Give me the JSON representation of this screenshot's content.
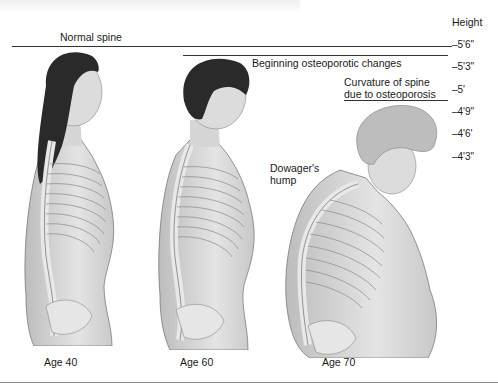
{
  "figure": {
    "height_axis": {
      "title": "Height",
      "ticks": [
        "–5'6\"",
        "–5'3\"",
        "–5'",
        "–4'9\"",
        "–4'6'",
        "–4'3\""
      ]
    },
    "labels": {
      "normal": "Normal spine",
      "beginning": "Beginning osteoporotic changes",
      "curvature_line1": "Curvature of spine",
      "curvature_line2": "due to osteoporosis",
      "dowager_line1": "Dowager's",
      "dowager_line2": "hump"
    },
    "ages": [
      "Age 40",
      "Age 60",
      "Age 70"
    ],
    "colors": {
      "skin": "#d9d9d9",
      "hair_dark": "#2a2a2a",
      "hair_grey": "#bdbdbd",
      "bone": "#efefef",
      "outline": "#6e6e6e"
    }
  }
}
